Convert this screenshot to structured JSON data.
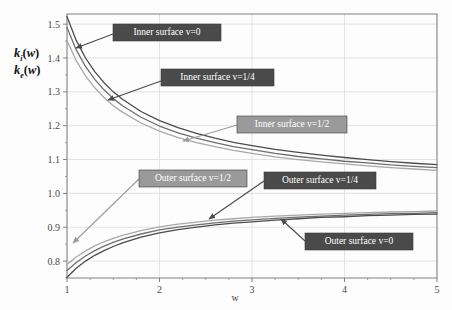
{
  "chart_data": {
    "type": "line",
    "title": "",
    "xlabel": "w",
    "ylabel_line1": "k_i(w)",
    "ylabel_line2": "k_e(w)",
    "xlim": [
      1,
      5
    ],
    "ylim": [
      0.75,
      1.53
    ],
    "xticks": [
      1,
      2,
      3,
      4,
      5
    ],
    "yticks": [
      0.8,
      0.9,
      1.0,
      1.1,
      1.2,
      1.3,
      1.4,
      1.5
    ],
    "xticklabels": [
      "1",
      "2",
      "3",
      "4",
      "5"
    ],
    "yticklabels": [
      "0.8",
      "0.9",
      "1.0",
      "1.1",
      "1.2",
      "1.3",
      "1.4",
      "1.5"
    ],
    "grid": true,
    "legend_position": "inline-annotations",
    "x": [
      1.0,
      1.1,
      1.2,
      1.3,
      1.4,
      1.5,
      1.6,
      1.8,
      2.0,
      2.2,
      2.4,
      2.6,
      2.8,
      3.0,
      3.25,
      3.5,
      3.75,
      4.0,
      4.25,
      4.5,
      4.75,
      5.0
    ],
    "series": [
      {
        "name": "Inner surface v=0",
        "color": "#4c4c4c",
        "values": [
          1.522,
          1.452,
          1.4,
          1.36,
          1.327,
          1.3,
          1.278,
          1.242,
          1.215,
          1.194,
          1.177,
          1.163,
          1.151,
          1.141,
          1.13,
          1.121,
          1.113,
          1.106,
          1.1,
          1.094,
          1.089,
          1.085
        ]
      },
      {
        "name": "Inner surface v=1/4",
        "color": "#6e6e6e",
        "values": [
          1.49,
          1.424,
          1.375,
          1.337,
          1.306,
          1.28,
          1.259,
          1.225,
          1.199,
          1.179,
          1.163,
          1.15,
          1.138,
          1.129,
          1.118,
          1.109,
          1.102,
          1.095,
          1.09,
          1.084,
          1.08,
          1.076
        ]
      },
      {
        "name": "Inner surface v=1/2",
        "color": "#a8a8a8",
        "values": [
          1.452,
          1.392,
          1.347,
          1.312,
          1.283,
          1.259,
          1.24,
          1.208,
          1.184,
          1.165,
          1.15,
          1.138,
          1.127,
          1.118,
          1.108,
          1.1,
          1.093,
          1.087,
          1.081,
          1.076,
          1.072,
          1.068
        ]
      },
      {
        "name": "Outer surface v=1/2",
        "color": "#a8a8a8",
        "values": [
          0.79,
          0.812,
          0.83,
          0.845,
          0.857,
          0.867,
          0.876,
          0.89,
          0.901,
          0.909,
          0.915,
          0.921,
          0.925,
          0.929,
          0.933,
          0.936,
          0.939,
          0.941,
          0.943,
          0.945,
          0.946,
          0.948
        ]
      },
      {
        "name": "Outer surface v=1/4",
        "color": "#6e6e6e",
        "values": [
          0.772,
          0.796,
          0.815,
          0.831,
          0.844,
          0.855,
          0.865,
          0.88,
          0.892,
          0.9,
          0.907,
          0.913,
          0.918,
          0.922,
          0.926,
          0.93,
          0.933,
          0.936,
          0.938,
          0.94,
          0.941,
          0.943
        ]
      },
      {
        "name": "Outer surface v=0",
        "color": "#4c4c4c",
        "values": [
          0.752,
          0.779,
          0.8,
          0.817,
          0.831,
          0.843,
          0.854,
          0.871,
          0.883,
          0.893,
          0.9,
          0.907,
          0.912,
          0.916,
          0.921,
          0.925,
          0.929,
          0.931,
          0.934,
          0.936,
          0.938,
          0.939
        ]
      }
    ],
    "annotations": [
      {
        "label": "Inner surface v=0",
        "style": "dark",
        "box": {
          "x": 113,
          "y": 24,
          "w": 108,
          "h": 17
        },
        "arrow": {
          "x1": 113,
          "y1": 34,
          "x2": 76,
          "y2": 48
        }
      },
      {
        "label": "Inner surface v=1/4",
        "style": "dark",
        "box": {
          "x": 161,
          "y": 69,
          "w": 113,
          "h": 17
        },
        "arrow": {
          "x1": 161,
          "y1": 81,
          "x2": 108,
          "y2": 100
        }
      },
      {
        "label": "Inner surface v=1/2",
        "style": "light",
        "box": {
          "x": 237,
          "y": 116,
          "w": 110,
          "h": 17
        },
        "arrow": {
          "x1": 237,
          "y1": 125,
          "x2": 183,
          "y2": 141
        }
      },
      {
        "label": "Outer surface v=1/2",
        "style": "light",
        "box": {
          "x": 139,
          "y": 170,
          "w": 108,
          "h": 17
        },
        "arrow": {
          "x1": 139,
          "y1": 179,
          "x2": 73,
          "y2": 243
        }
      },
      {
        "label": "Outer surface v=1/4",
        "style": "dark",
        "box": {
          "x": 264,
          "y": 172,
          "w": 112,
          "h": 17
        },
        "arrow": {
          "x1": 264,
          "y1": 181,
          "x2": 209,
          "y2": 219
        }
      },
      {
        "label": "Outer surface v=0",
        "style": "dark",
        "box": {
          "x": 305,
          "y": 233,
          "w": 108,
          "h": 17
        },
        "arrow": {
          "x1": 305,
          "y1": 241,
          "x2": 281,
          "y2": 219
        }
      }
    ]
  },
  "colors": {
    "dark_box": "#4a4a4a",
    "light_box": "#9a9a9a",
    "box_text": "#ffffff",
    "grid": "#dcdcdc",
    "axis": "#808080",
    "tick_text": "#4a4a4a"
  }
}
